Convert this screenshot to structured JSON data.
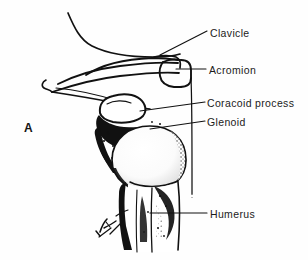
{
  "figure": {
    "panel_letter": "A",
    "view": "anterior shoulder girdle radiographic tracing",
    "ink_color": "#111111",
    "background_color": "#fefefe",
    "width": 308,
    "height": 260
  },
  "labels": [
    {
      "id": "clavicle",
      "text": "Clavicle",
      "text_x": 210,
      "text_y": 28,
      "leader": {
        "x1": 207,
        "y1": 31,
        "x2": 160,
        "y2": 55
      }
    },
    {
      "id": "acromion",
      "text": "Acromion",
      "text_x": 209,
      "text_y": 65,
      "leader": {
        "x1": 206,
        "y1": 69,
        "x2": 176,
        "y2": 69
      }
    },
    {
      "id": "coracoid-process",
      "text": "Coracoid process",
      "text_x": 207,
      "text_y": 98,
      "leader": {
        "x1": 205,
        "y1": 102,
        "x2": 140,
        "y2": 111
      }
    },
    {
      "id": "glenoid",
      "text": "Glenoid",
      "text_x": 207,
      "text_y": 117,
      "leader": {
        "x1": 205,
        "y1": 121,
        "x2": 150,
        "y2": 129
      }
    },
    {
      "id": "humerus",
      "text": "Humerus",
      "text_x": 210,
      "text_y": 209,
      "leader": {
        "x1": 207,
        "y1": 213,
        "x2": 150,
        "y2": 213
      }
    }
  ],
  "artist_mark": {
    "present": true,
    "description": "small hand-written signature at lower-left of humeral shaft",
    "x": 105,
    "y": 225
  },
  "anatomy_parts": [
    {
      "name": "clavicle",
      "render": "long slender curved bone crossing upper field from left to acromion"
    },
    {
      "name": "acromion",
      "render": "blocky hooked lateral process articulating with clavicle"
    },
    {
      "name": "scapular-spine",
      "render": "converging outline lines fanning to the left margin"
    },
    {
      "name": "coracoid-process",
      "render": "rounded white beak-shaped ossicle above the glenoid"
    },
    {
      "name": "glenoid",
      "render": "dense black articular fossa shading beneath coracoid"
    },
    {
      "name": "humeral-head",
      "render": "large rounded white sphere with stippled margins"
    },
    {
      "name": "humeral-shaft",
      "render": "tapering vertical shaft descending to lower border"
    },
    {
      "name": "scapula-lateral-border",
      "render": "long thin vertical line fading out near y=195"
    }
  ]
}
